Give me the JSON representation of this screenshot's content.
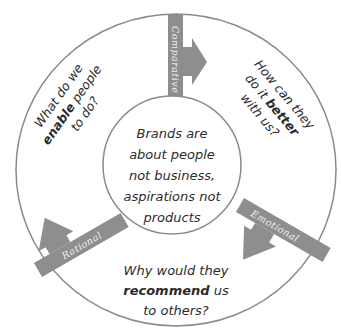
{
  "diagram": {
    "center": {
      "lines": [
        "Brands are",
        "about people",
        "not business,",
        "aspirations not",
        "products"
      ]
    },
    "segments": {
      "top_left": {
        "line1": "What do we",
        "line2_bold": "enable",
        "line2_rest": " people",
        "line3": "to do?"
      },
      "top_right": {
        "line1": "How can they",
        "line2_pre": "do it ",
        "line2_bold": "better",
        "line3": "with us?"
      },
      "bottom": {
        "line1": "Why would they",
        "line2_bold": "recommend",
        "line2_rest": " us",
        "line3": "to others?"
      }
    },
    "spokes": {
      "top": {
        "label": "Comparative"
      },
      "left": {
        "label": "Rational"
      },
      "right": {
        "label": "Emotional"
      }
    },
    "colors": {
      "outline": "#8a8a8a",
      "spoke": "#8e8e8e",
      "text": "#2b2b2b",
      "background": "#ffffff"
    }
  }
}
